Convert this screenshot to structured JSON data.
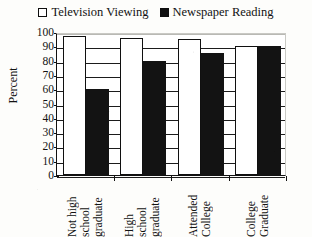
{
  "chart_data": {
    "type": "bar",
    "title": "",
    "subtitle": "",
    "xlabel": "",
    "ylabel": "Percent",
    "ylim": [
      0,
      100
    ],
    "yticks": [
      0,
      10,
      20,
      30,
      40,
      50,
      60,
      70,
      80,
      90,
      100
    ],
    "ytick_labels": [
      "0",
      "10",
      "20",
      "30",
      "40",
      "50",
      "60",
      "70",
      "80",
      "90",
      "100"
    ],
    "grid": true,
    "legend_position": "top-center",
    "categories": [
      "Not high school graduate",
      "High school graduate",
      "Attended College",
      "College Graduate"
    ],
    "category_lines": [
      [
        "Not high",
        "school",
        "graduate"
      ],
      [
        "High",
        "school",
        "graduate"
      ],
      [
        "Attended",
        "College"
      ],
      [
        "College",
        "Graduate"
      ]
    ],
    "series": [
      {
        "name": "Television Viewing",
        "color": "#ffffff",
        "edge_color": "#101010",
        "fill": "open",
        "values": [
          97,
          96,
          95,
          90
        ]
      },
      {
        "name": "Newspaper Reading",
        "color": "#131313",
        "edge_color": "#131313",
        "fill": "solid",
        "values": [
          60,
          80,
          85,
          90
        ]
      }
    ]
  },
  "legend": {
    "entries": [
      {
        "label": "Television Viewing",
        "marker": "open-square-icon"
      },
      {
        "label": "Newspaper Reading",
        "marker": "filled-square-icon"
      }
    ]
  }
}
